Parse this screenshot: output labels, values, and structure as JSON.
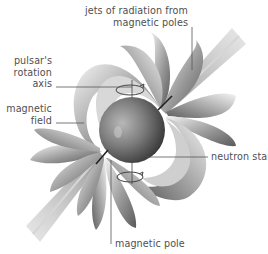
{
  "diagram": {
    "subject": "pulsar",
    "colors": {
      "background": "#ffffff",
      "label_text": "#4f4f4f",
      "leader_line": "#555555",
      "star_light": "#b0b0b0",
      "star_dark": "#2e2e2e",
      "field_light": "#f2f2f2",
      "field_dark": "#6a6a6a",
      "jet": "#9a9a9a"
    },
    "labels": {
      "jets": {
        "line1": "jets of radiation from",
        "line2": "magnetic poles"
      },
      "rotation_axis": {
        "line1": "pulsar's",
        "line2": "rotation",
        "line3": "axis"
      },
      "magnetic_field": {
        "line1": "magnetic",
        "line2": "field"
      },
      "neutron_star": {
        "line1": "neutron star"
      },
      "magnetic_pole": {
        "line1": "magnetic pole"
      }
    }
  }
}
